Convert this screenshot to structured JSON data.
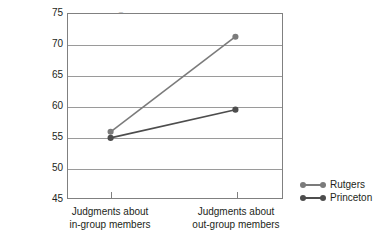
{
  "chart_data": {
    "type": "line",
    "title": "",
    "xlabel": "",
    "ylabel": "Percentage of students estimated to make similar choice as target person",
    "ylabel_lines": [
      "Percentage of students estimated to",
      "make similar choice as target person"
    ],
    "categories": [
      "Judgments about in-group members",
      "Judgments about out-group members"
    ],
    "category_lines": [
      [
        "Judgments about",
        "in-group members"
      ],
      [
        "Judgments about",
        "out-group members"
      ]
    ],
    "ylim": [
      45,
      75
    ],
    "yticks": [
      75,
      70,
      65,
      60,
      55,
      50,
      45
    ],
    "ytick_labels": [
      "75",
      "70",
      "65",
      "60",
      "55",
      "50",
      "45"
    ],
    "grid": true,
    "legend_position": "right",
    "series": [
      {
        "name": "Rutgers",
        "values": [
          55.8,
          71.3
        ],
        "color": "#7b7b7b"
      },
      {
        "name": "Princeton",
        "values": [
          54.8,
          59.4
        ],
        "color": "#4d4d4d"
      }
    ]
  },
  "legend": {
    "entries": [
      {
        "label": "Rutgers"
      },
      {
        "label": "Princeton"
      }
    ]
  },
  "colors": {
    "rutgers": "#7b7b7b",
    "princeton": "#4d4d4d",
    "grid": "#9a9a9a",
    "frame": "#808080",
    "text": "#231f20"
  }
}
